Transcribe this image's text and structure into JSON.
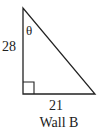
{
  "diagram": {
    "type": "right-triangle",
    "vertical_leg": {
      "label": "28"
    },
    "horizontal_leg": {
      "label": "21"
    },
    "angle": {
      "label": "θ",
      "position": "top-vertex"
    },
    "right_angle_marker": true,
    "caption": "Wall B",
    "colors": {
      "stroke": "#222222",
      "background": "#ffffff"
    }
  }
}
